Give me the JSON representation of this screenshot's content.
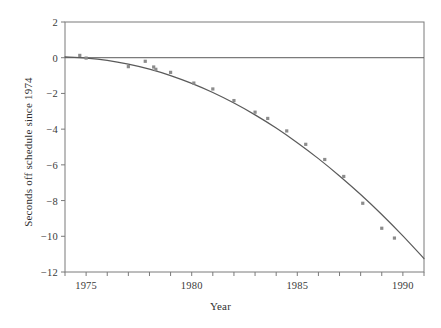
{
  "chart_data": {
    "type": "scatter",
    "title": "",
    "xlabel": "Year",
    "ylabel": "Seconds off schedule since 1974",
    "xlim": [
      1974,
      1991
    ],
    "ylim": [
      -12,
      2
    ],
    "grid": false,
    "legend": "none",
    "x_major_ticks": [
      1975,
      1980,
      1985,
      1990
    ],
    "x_minor_ticks": [
      1974,
      1976,
      1977,
      1978,
      1979,
      1981,
      1982,
      1983,
      1984,
      1986,
      1987,
      1988,
      1989,
      1991
    ],
    "x_tick_labels": [
      "1975",
      "1980",
      "1985",
      "1990"
    ],
    "y_ticks": [
      2,
      0,
      -2,
      -4,
      -6,
      -8,
      -10,
      -12
    ],
    "y_tick_labels": [
      "2",
      "0",
      "−2",
      "−4",
      "−6",
      "−8",
      "−10",
      "−12"
    ],
    "reference_line_y": 0,
    "marker_color": "#8c8c8c",
    "line_color": "#5a5a5a",
    "axis_color": "#7a7a7a",
    "marker_shape": "square",
    "series": [
      {
        "name": "observations",
        "type": "scatter",
        "x": [
          1974.7,
          1975.0,
          1977.0,
          1977.8,
          1978.2,
          1978.3,
          1979.0,
          1980.1,
          1981.0,
          1982.0,
          1983.0,
          1983.6,
          1984.5,
          1985.4,
          1986.3,
          1987.2,
          1988.1,
          1989.0,
          1989.6
        ],
        "y": [
          0.13,
          -0.02,
          -0.5,
          -0.2,
          -0.52,
          -0.65,
          -0.82,
          -1.42,
          -1.75,
          -2.4,
          -3.05,
          -3.4,
          -4.1,
          -4.85,
          -5.7,
          -6.65,
          -8.15,
          -9.55,
          -10.1
        ]
      },
      {
        "name": "fitted curve",
        "type": "line",
        "x": [
          1974.0,
          1975.0,
          1976.0,
          1977.0,
          1978.0,
          1979.0,
          1980.0,
          1981.0,
          1982.0,
          1983.0,
          1984.0,
          1985.0,
          1986.0,
          1987.0,
          1988.0,
          1989.0,
          1990.0,
          1991.0
        ],
        "y": [
          0.05,
          -0.02,
          -0.15,
          -0.36,
          -0.64,
          -1.0,
          -1.44,
          -1.95,
          -2.54,
          -3.2,
          -3.94,
          -4.76,
          -5.65,
          -6.62,
          -7.66,
          -8.78,
          -9.98,
          -11.25
        ]
      }
    ]
  }
}
